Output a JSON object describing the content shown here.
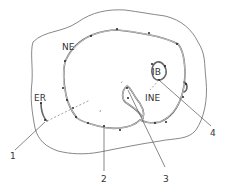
{
  "diagram": {
    "labels": {
      "ne": "NE",
      "er": "ER",
      "ib": "IB",
      "ine": "INE"
    },
    "callouts": [
      "1",
      "2",
      "3",
      "4"
    ],
    "colors": {
      "line": "#555555",
      "membrane": "#666666",
      "dot": "#222222",
      "background": "#ffffff"
    }
  }
}
